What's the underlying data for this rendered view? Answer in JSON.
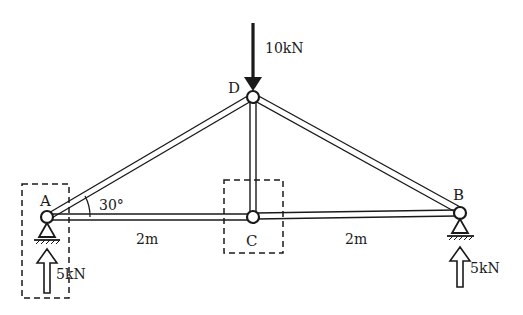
{
  "diagram": {
    "type": "truss",
    "nodes": {
      "A": {
        "label": "A"
      },
      "B": {
        "label": "B"
      },
      "C": {
        "label": "C"
      },
      "D": {
        "label": "D"
      }
    },
    "angle_label": "30°",
    "dimensions": {
      "AC": "2m",
      "CB": "2m"
    },
    "loads": {
      "D": "10kN"
    },
    "reactions": {
      "A": "5kN",
      "B": "5kN"
    },
    "colors": {
      "line": "#1a1a1a",
      "background": "#ffffff"
    }
  }
}
